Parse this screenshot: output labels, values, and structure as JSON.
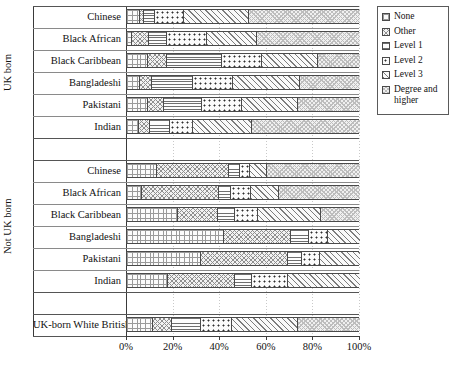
{
  "chart_data": {
    "type": "bar",
    "orientation": "horizontal",
    "stacked": true,
    "normalized": true,
    "title": "",
    "xlabel": "",
    "ylabel": "",
    "xlim": [
      0,
      100
    ],
    "xticks": [
      "0%",
      "20%",
      "40%",
      "60%",
      "80%",
      "100%"
    ],
    "xtick_values": [
      0,
      20,
      40,
      60,
      80,
      100
    ],
    "grid": "vertical dotted gridlines at ticks",
    "legend_position": "right, outside plot",
    "series": [
      {
        "name": "None",
        "key": "none",
        "pattern": "fine-grid"
      },
      {
        "name": "Other",
        "key": "other",
        "pattern": "crosshatch-diagonal"
      },
      {
        "name": "Level 1",
        "key": "l1",
        "pattern": "horizontal-lines"
      },
      {
        "name": "Level 2",
        "key": "l2",
        "pattern": "large-dots"
      },
      {
        "name": "Level 3",
        "key": "l3",
        "pattern": "diagonal-hatch"
      },
      {
        "name": "Degree and higher",
        "key": "deg",
        "pattern": "light-crosshatch"
      }
    ],
    "groups": [
      {
        "label": "UK born",
        "categories": [
          {
            "label": "Chinese",
            "values": [
              5.7,
              1.5,
              4.8,
              12.5,
              28.0,
              47.5
            ]
          },
          {
            "label": "Black African",
            "values": [
              2.3,
              7.1,
              7.6,
              17.2,
              21.4,
              44.4
            ]
          },
          {
            "label": "Black Caribbean",
            "values": [
              9.1,
              7.9,
              23.6,
              17.2,
              24.0,
              18.2
            ]
          },
          {
            "label": "Bangladeshi",
            "values": [
              5.6,
              5.3,
              17.6,
              17.1,
              28.6,
              25.8
            ]
          },
          {
            "label": "Pakistani",
            "values": [
              8.9,
              7.1,
              16.3,
              17.2,
              24.0,
              26.5
            ]
          },
          {
            "label": "Indian",
            "values": [
              5.2,
              4.7,
              8.6,
              10.0,
              25.0,
              46.5
            ]
          }
        ]
      },
      {
        "label": "Not UK born",
        "categories": [
          {
            "label": "Chinese",
            "values": [
              12.7,
              31.1,
              4.7,
              4.3,
              7.2,
              40.0
            ]
          },
          {
            "label": "Black African",
            "values": [
              6.3,
              33.2,
              5.1,
              8.6,
              12.0,
              34.8
            ]
          },
          {
            "label": "Black Caribbean",
            "values": [
              22.0,
              16.9,
              7.5,
              10.0,
              26.9,
              16.7
            ]
          },
          {
            "label": "Bangladeshi",
            "values": [
              41.8,
              28.6,
              7.7,
              8.0,
              13.9,
              0.0
            ]
          },
          {
            "label": "Pakistani",
            "values": [
              31.8,
              37.2,
              6.0,
              7.8,
              17.2,
              0.0
            ]
          },
          {
            "label": "Indian",
            "values": [
              17.7,
              28.7,
              7.4,
              15.2,
              31.0,
              0.0
            ]
          }
        ]
      },
      {
        "label": "",
        "categories": [
          {
            "label": "UK-born White British",
            "values": [
              11.3,
              7.9,
              12.6,
              13.1,
              28.4,
              26.7
            ]
          }
        ]
      }
    ]
  },
  "legend": {
    "items": [
      {
        "label": "None"
      },
      {
        "label": "Other"
      },
      {
        "label": "Level 1"
      },
      {
        "label": "Level 2"
      },
      {
        "label": "Level 3"
      },
      {
        "label": "Degree and higher"
      }
    ]
  },
  "axis": {
    "group_titles": [
      "UK born",
      "Not UK born"
    ],
    "ticks": [
      "0%",
      "20%",
      "40%",
      "60%",
      "80%",
      "100%"
    ]
  },
  "colors": {
    "ink": "#1a1a1a",
    "frame": "#4a4a4a",
    "grid": "#c9c9c9",
    "background": "#ffffff"
  }
}
